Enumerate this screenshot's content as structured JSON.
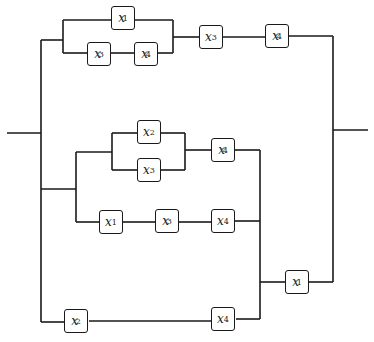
{
  "diagram": {
    "type": "switching-circuit",
    "switches": [
      {
        "id": "s1",
        "var": "x",
        "index": "1",
        "complement": true,
        "pos": [
          111,
          6
        ]
      },
      {
        "id": "s2",
        "var": "x",
        "index": "3",
        "complement": true,
        "pos": [
          87,
          42
        ]
      },
      {
        "id": "s3",
        "var": "x",
        "index": "4",
        "complement": true,
        "pos": [
          134,
          42
        ]
      },
      {
        "id": "s4",
        "var": "x",
        "index": "3",
        "complement": false,
        "pos": [
          199,
          25
        ]
      },
      {
        "id": "s5",
        "var": "x",
        "index": "4",
        "complement": true,
        "pos": [
          265,
          24
        ]
      },
      {
        "id": "s6",
        "var": "x",
        "index": "2",
        "complement": false,
        "pos": [
          137,
          120
        ]
      },
      {
        "id": "s7",
        "var": "x",
        "index": "3",
        "complement": false,
        "pos": [
          137,
          158
        ]
      },
      {
        "id": "s8",
        "var": "x",
        "index": "4",
        "complement": true,
        "pos": [
          211,
          138
        ]
      },
      {
        "id": "s9",
        "var": "x",
        "index": "1",
        "complement": false,
        "pos": [
          99,
          210
        ]
      },
      {
        "id": "s10",
        "var": "x",
        "index": "3",
        "complement": true,
        "pos": [
          155,
          209
        ]
      },
      {
        "id": "s11",
        "var": "x",
        "index": "4",
        "complement": false,
        "pos": [
          211,
          209
        ]
      },
      {
        "id": "s12",
        "var": "x",
        "index": "1",
        "complement": true,
        "pos": [
          285,
          270
        ]
      },
      {
        "id": "s13",
        "var": "x",
        "index": "2",
        "complement": true,
        "pos": [
          64,
          309
        ]
      },
      {
        "id": "s14",
        "var": "x",
        "index": "4",
        "complement": false,
        "pos": [
          211,
          307
        ]
      }
    ],
    "prime_mark": "′",
    "wires": [
      "M7 133 H41",
      "M41 40 V322",
      "M41 40 H63",
      "M63 20 V53",
      "M63 20 H111",
      "M135 20 H173",
      "M63 53 H87",
      "M111 53 H134",
      "M158 53 H173",
      "M173 20 V53",
      "M173 37 H199",
      "M223 37 H265",
      "M289 36 H333",
      "M333 36 V282",
      "M333 130 H368",
      "M41 189 H76",
      "M76 152 V222",
      "M76 152 H112",
      "M112 133 V170",
      "M112 133 H137",
      "M112 170 H137",
      "M161 133 H185",
      "M161 170 H185",
      "M185 133 V170",
      "M185 150 H211",
      "M235 150 H260",
      "M76 222 H99",
      "M123 222 H155",
      "M179 222 H211",
      "M235 221 H260",
      "M260 150 V319",
      "M260 282 H285",
      "M309 282 H333",
      "M41 322 H64",
      "M89 321 H211",
      "M236 319 H260"
    ]
  }
}
